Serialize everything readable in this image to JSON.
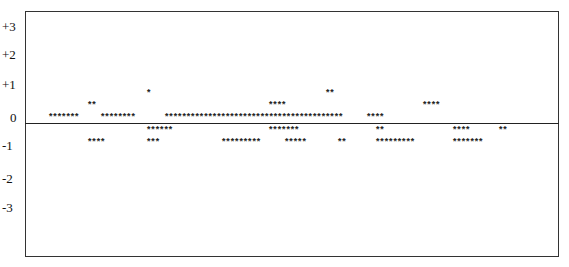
{
  "chart_data": {
    "type": "scatter",
    "title": "",
    "xlabel": "",
    "ylabel": "",
    "ylim": [
      -4,
      3.5
    ],
    "grid": false,
    "legend": null,
    "y_ticks": [
      "+3",
      "+2",
      "+1",
      "0",
      "-1",
      "-2",
      "-3"
    ],
    "baseline_value": 0,
    "marker": "*",
    "groups": [
      {
        "text": "*******",
        "x": 48,
        "y": 114,
        "level": "0"
      },
      {
        "text": "**",
        "x": 87,
        "y": 102,
        "level": "+0.5"
      },
      {
        "text": "********",
        "x": 100,
        "y": 114,
        "level": "0"
      },
      {
        "text": "*",
        "x": 146,
        "y": 90,
        "level": "+1"
      },
      {
        "text": "*****************************************",
        "x": 164,
        "y": 114,
        "level": "0"
      },
      {
        "text": "****",
        "x": 268,
        "y": 102,
        "level": "+0.5"
      },
      {
        "text": "**",
        "x": 325,
        "y": 90,
        "level": "+1"
      },
      {
        "text": "****",
        "x": 366,
        "y": 114,
        "level": "0"
      },
      {
        "text": "****",
        "x": 422,
        "y": 102,
        "level": "+0.5"
      },
      {
        "text": "******",
        "x": 146,
        "y": 127,
        "level": "-0.5"
      },
      {
        "text": "*******",
        "x": 268,
        "y": 127,
        "level": "-0.5"
      },
      {
        "text": "**",
        "x": 375,
        "y": 127,
        "level": "-0.5"
      },
      {
        "text": "****",
        "x": 452,
        "y": 127,
        "level": "-0.5"
      },
      {
        "text": "**",
        "x": 498,
        "y": 127,
        "level": "-0.5"
      },
      {
        "text": "****",
        "x": 87,
        "y": 139,
        "level": "-1"
      },
      {
        "text": "***",
        "x": 146,
        "y": 139,
        "level": "-1"
      },
      {
        "text": "*********",
        "x": 221,
        "y": 139,
        "level": "-1"
      },
      {
        "text": "*****",
        "x": 284,
        "y": 139,
        "level": "-1"
      },
      {
        "text": "**",
        "x": 337,
        "y": 139,
        "level": "-1"
      },
      {
        "text": "*********",
        "x": 375,
        "y": 139,
        "level": "-1"
      },
      {
        "text": "*******",
        "x": 452,
        "y": 139,
        "level": "-1"
      }
    ]
  },
  "axis": {
    "ticks": [
      {
        "label": "+3",
        "y": 20
      },
      {
        "label": "+2",
        "y": 48
      },
      {
        "label": "+1",
        "y": 78
      },
      {
        "label": "0",
        "y": 111
      },
      {
        "label": "-1",
        "y": 139
      },
      {
        "label": "-2",
        "y": 172
      },
      {
        "label": "-3",
        "y": 201
      }
    ]
  }
}
